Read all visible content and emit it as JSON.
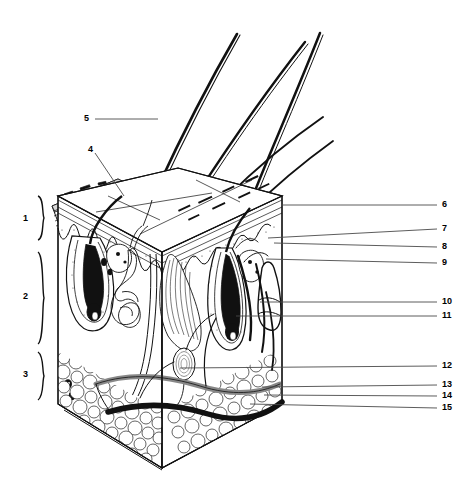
{
  "figure": {
    "type": "anatomical-diagram",
    "view": "three-dimensional block / wedge section",
    "style": "black-and-white line art, stippled shading",
    "background_color": "#ffffff",
    "ink_color": "#000000",
    "leader_color": "#4a4a4a"
  },
  "bracket_labels": [
    {
      "id": "1",
      "text": "1",
      "x": 24,
      "y": 219,
      "brace_top": 196,
      "brace_bottom": 240,
      "region": "epidermis"
    },
    {
      "id": "2",
      "text": "2",
      "x": 24,
      "y": 297,
      "brace_top": 252,
      "brace_bottom": 344,
      "region": "dermis"
    },
    {
      "id": "3",
      "text": "3",
      "x": 24,
      "y": 375,
      "brace_top": 352,
      "brace_bottom": 400,
      "region": "hypodermis"
    }
  ],
  "left_callouts": [
    {
      "id": "5",
      "text": "5",
      "x": 84,
      "y": 119,
      "line": {
        "x1": 95,
        "y1": 119,
        "x2": 158,
        "y2": 119
      },
      "target": "hair shaft"
    },
    {
      "id": "4",
      "text": "4",
      "x": 88,
      "y": 150,
      "line": {
        "x1": 95,
        "y1": 153,
        "x2": 124,
        "y2": 196
      },
      "target": "epidermis magnified wedge"
    }
  ],
  "right_callouts": [
    {
      "id": "6",
      "text": "6",
      "x": 443,
      "y": 204,
      "line": {
        "x1": 281,
        "y1": 205,
        "x2": 437,
        "y2": 205
      }
    },
    {
      "id": "7",
      "text": "7",
      "x": 443,
      "y": 228,
      "line": {
        "x1": 268,
        "y1": 238,
        "x2": 437,
        "y2": 229
      }
    },
    {
      "id": "8",
      "text": "8",
      "x": 443,
      "y": 247,
      "line": {
        "x1": 274,
        "y1": 243,
        "x2": 437,
        "y2": 247
      }
    },
    {
      "id": "9",
      "text": "9",
      "x": 443,
      "y": 263,
      "line": {
        "x1": 266,
        "y1": 259,
        "x2": 437,
        "y2": 263
      }
    },
    {
      "id": "10",
      "text": "10",
      "x": 443,
      "y": 302,
      "line": {
        "x1": 260,
        "y1": 302,
        "x2": 437,
        "y2": 302
      }
    },
    {
      "id": "11",
      "text": "11",
      "x": 443,
      "y": 316,
      "line": {
        "x1": 236,
        "y1": 316,
        "x2": 437,
        "y2": 316
      }
    },
    {
      "id": "12",
      "text": "12",
      "x": 443,
      "y": 366,
      "line": {
        "x1": 180,
        "y1": 368,
        "x2": 437,
        "y2": 366
      }
    },
    {
      "id": "13",
      "text": "13",
      "x": 443,
      "y": 385,
      "line": {
        "x1": 262,
        "y1": 387,
        "x2": 437,
        "y2": 385
      }
    },
    {
      "id": "14",
      "text": "14",
      "x": 443,
      "y": 396,
      "line": {
        "x1": 264,
        "y1": 395,
        "x2": 437,
        "y2": 396
      }
    },
    {
      "id": "15",
      "text": "15",
      "x": 443,
      "y": 408,
      "line": {
        "x1": 250,
        "y1": 404,
        "x2": 437,
        "y2": 408
      }
    }
  ],
  "structures": [
    {
      "name": "hair-shafts",
      "count": 4,
      "description": "long curving hairs rising above the skin surface"
    },
    {
      "name": "epidermis-wedge-callout",
      "description": "magnified peeled-back slab of stratified epidermis at upper left"
    },
    {
      "name": "epidermis-layer",
      "description": "banded surface layer across top of block"
    },
    {
      "name": "dermal-papillae",
      "description": "wavy stippled dermal-epidermal junction"
    },
    {
      "name": "hair-follicle-left",
      "description": "large follicle with dark bulb, left of block"
    },
    {
      "name": "hair-follicle-right",
      "description": "follicle with bulb, right of centre"
    },
    {
      "name": "sweat-gland-coiled",
      "description": "coiled tubular gland with duct rising to surface"
    },
    {
      "name": "arrector-pili-muscle",
      "description": "striated fan of muscle fibres attaching to follicle"
    },
    {
      "name": "sebaceous-glands",
      "description": "lobed glands beside follicles"
    },
    {
      "name": "sensory-nerve-ending",
      "description": "club-shaped receptor at right of dermis"
    },
    {
      "name": "pacinian-corpuscle",
      "description": "oval onion-layered receptor in hypodermis"
    },
    {
      "name": "adipose-tissue",
      "description": "cobblestone fat cells filling the hypodermis"
    },
    {
      "name": "artery",
      "description": "dark solid vessel running through hypodermis"
    },
    {
      "name": "vein",
      "description": "outlined vessel running beside artery"
    },
    {
      "name": "melanocytes",
      "description": "small dark cells at lower left cut face"
    }
  ]
}
